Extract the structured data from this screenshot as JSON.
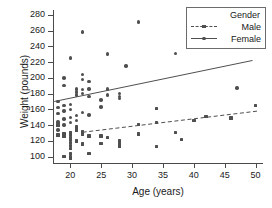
{
  "chart_data": {
    "type": "scatter",
    "title": "",
    "xlabel": "Age (years)",
    "ylabel": "Weight (pounds)",
    "xlim": [
      17.2,
      51.2
    ],
    "ylim": [
      92,
      286
    ],
    "xticks": [
      20,
      25,
      30,
      35,
      40,
      45,
      50
    ],
    "yticks": [
      100,
      120,
      140,
      160,
      180,
      200,
      220,
      240,
      260,
      280
    ],
    "grid": false,
    "legend": {
      "position": "top-right",
      "title": "Gender",
      "entries": [
        {
          "name": "Male",
          "marker": "square",
          "line": "dashed",
          "color": "#4f4f4f"
        },
        {
          "name": "Female",
          "marker": "circle",
          "line": "solid",
          "color": "#4f4f4f"
        }
      ]
    },
    "series": [
      {
        "name": "Female",
        "marker": "circle",
        "color": "#4f4f4f",
        "points": [
          [
            18,
            170
          ],
          [
            18,
            162
          ],
          [
            18,
            155
          ],
          [
            18,
            144
          ],
          [
            18,
            134
          ],
          [
            19,
            200
          ],
          [
            19,
            190
          ],
          [
            19,
            165
          ],
          [
            19,
            158
          ],
          [
            19,
            148
          ],
          [
            19,
            140
          ],
          [
            19,
            128
          ],
          [
            20,
            225
          ],
          [
            20,
            166
          ],
          [
            20,
            160
          ],
          [
            20,
            150
          ],
          [
            20,
            143
          ],
          [
            20,
            130
          ],
          [
            20,
            125
          ],
          [
            21,
            186
          ],
          [
            21,
            182
          ],
          [
            21,
            178
          ],
          [
            21,
            152
          ],
          [
            21,
            146
          ],
          [
            21,
            137
          ],
          [
            22,
            258
          ],
          [
            22,
            204
          ],
          [
            22,
            198
          ],
          [
            22,
            185
          ],
          [
            22,
            180
          ],
          [
            22,
            156
          ],
          [
            23,
            195
          ],
          [
            23,
            186
          ],
          [
            23,
            176
          ],
          [
            23,
            153
          ],
          [
            25,
            172
          ],
          [
            25,
            163
          ],
          [
            26,
            230
          ],
          [
            26,
            186
          ],
          [
            26,
            178
          ],
          [
            28,
            180
          ],
          [
            28,
            176
          ],
          [
            28,
            174
          ],
          [
            29,
            215
          ],
          [
            31,
            271
          ],
          [
            37,
            231
          ],
          [
            47,
            187
          ]
        ]
      },
      {
        "name": "Male",
        "marker": "square",
        "color": "#4f4f4f",
        "points": [
          [
            18,
            140
          ],
          [
            18,
            128
          ],
          [
            18,
            127
          ],
          [
            19,
            129
          ],
          [
            19,
            126
          ],
          [
            19,
            100
          ],
          [
            20,
            130
          ],
          [
            20,
            128
          ],
          [
            20,
            122
          ],
          [
            20,
            118
          ],
          [
            20,
            114
          ],
          [
            20,
            110
          ],
          [
            20,
            104
          ],
          [
            20,
            100
          ],
          [
            20,
            98
          ],
          [
            21,
            138
          ],
          [
            21,
            136
          ],
          [
            21,
            134
          ],
          [
            21,
            120
          ],
          [
            22,
            132
          ],
          [
            22,
            130
          ],
          [
            22,
            128
          ],
          [
            22,
            116
          ],
          [
            23,
            126
          ],
          [
            23,
            104
          ],
          [
            25,
            126
          ],
          [
            25,
            117
          ],
          [
            26,
            124
          ],
          [
            28,
            120
          ],
          [
            28,
            116
          ],
          [
            28,
            113
          ],
          [
            31,
            141
          ],
          [
            31,
            129
          ],
          [
            34,
            161
          ],
          [
            34,
            143
          ],
          [
            34,
            113
          ],
          [
            37,
            131
          ],
          [
            38,
            122
          ],
          [
            40,
            146
          ],
          [
            42,
            151
          ],
          [
            46,
            149
          ],
          [
            50,
            165
          ]
        ]
      }
    ],
    "trendlines": [
      {
        "series": "Female",
        "style": "solid",
        "x": [
          17.4,
          49.5
        ],
        "y": [
          170,
          222
        ]
      },
      {
        "series": "Male",
        "style": "dashed",
        "x": [
          22.0,
          50.5
        ],
        "y": [
          131,
          158
        ]
      }
    ]
  }
}
